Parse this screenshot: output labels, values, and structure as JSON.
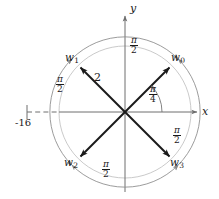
{
  "figure": {
    "type": "complex-plane-roots-diagram",
    "axes": {
      "x_label": "x",
      "y_label": "y",
      "x_tick_label": "-16"
    },
    "magnitude_label": "2",
    "angle_label": {
      "numerator": "π",
      "denominator": "4"
    },
    "separation_label": {
      "numerator": "π",
      "denominator": "2"
    },
    "roots": [
      {
        "name": "w",
        "index": "0",
        "angle_deg": 45,
        "magnitude": 2
      },
      {
        "name": "w",
        "index": "1",
        "angle_deg": 135,
        "magnitude": 2
      },
      {
        "name": "w",
        "index": "2",
        "angle_deg": 225,
        "magnitude": 2
      },
      {
        "name": "w",
        "index": "3",
        "angle_deg": 315,
        "magnitude": 2
      }
    ],
    "separation_arcs": [
      {
        "id": "arc-w1-w0",
        "label_numerator": "π",
        "label_denominator": "2"
      },
      {
        "id": "arc-w2-w1",
        "label_numerator": "π",
        "label_denominator": "2"
      },
      {
        "id": "arc-w3-w0",
        "label_numerator": "π",
        "label_denominator": "2"
      },
      {
        "id": "arc-w2-w3",
        "label_numerator": "π",
        "label_denominator": "2"
      }
    ],
    "colors": {
      "vector": "#1a1a1a",
      "axis": "#6e6e6e",
      "arc": "#8a8a8a",
      "text": "#1a1a1a",
      "background": "#ffffff"
    }
  }
}
